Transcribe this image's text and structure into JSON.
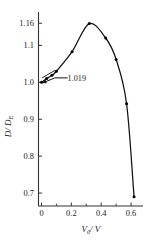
{
  "chart_data": {
    "type": "line",
    "title": "",
    "xlabel": "V0 / V",
    "ylabel": "D / DE",
    "xlim": [
      -0.02,
      0.68
    ],
    "ylim": [
      0.665,
      1.185
    ],
    "grid": false,
    "legend": null,
    "x_ticks": [
      0,
      0.2,
      0.4,
      0.6
    ],
    "x_tick_labels": [
      "0",
      "0.2",
      "0.4",
      "0.6"
    ],
    "x_minor_ticks": [
      0.1,
      0.3,
      0.5
    ],
    "y_ticks": [
      0.7,
      0.8,
      0.9,
      1.0,
      1.1,
      1.16
    ],
    "y_tick_labels": [
      "0.7",
      "0.8",
      "0.9",
      "1.0",
      "1.1",
      "1.16"
    ],
    "marker": "filled-circle",
    "series": [
      {
        "name": "D/DE vs V0/V",
        "x": [
          0.0,
          0.035,
          0.07,
          0.1,
          0.205,
          0.32,
          0.43,
          0.5,
          0.57,
          0.62
        ],
        "values": [
          1.0,
          1.01,
          1.019,
          1.03,
          1.083,
          1.159,
          1.12,
          1.062,
          0.942,
          0.69
        ]
      }
    ],
    "annotations": [
      {
        "text": "1.019",
        "x": 0.07,
        "y": 1.019,
        "label_x": 0.165,
        "label_y": 1.012,
        "style": "leader-line-with-arrow"
      }
    ]
  },
  "axis_titles": {
    "x_main": "V",
    "x_sub": "0",
    "x_rest": "/ V",
    "y_main": "D",
    "y_rest": "/ D",
    "y_sub": "E"
  },
  "colors": {
    "axis": "#333333",
    "curve": "#111111",
    "marker": "#000000",
    "text": "#1a1a1a",
    "background": "#ffffff"
  }
}
